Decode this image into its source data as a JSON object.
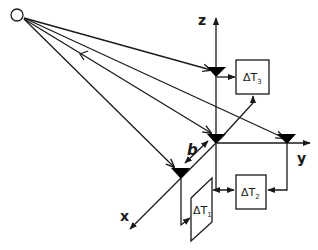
{
  "diagram": {
    "title": "",
    "source_point": {
      "label": "",
      "shape": "open-circle"
    },
    "axes": {
      "z": {
        "label": "z"
      },
      "y": {
        "label": "y"
      },
      "x": {
        "label": "x"
      }
    },
    "baseline_label": "b",
    "sensors": [
      {
        "id": "sensor-top",
        "shape": "filled-triangle"
      },
      {
        "id": "sensor-origin",
        "shape": "filled-triangle"
      },
      {
        "id": "sensor-right",
        "shape": "filled-triangle"
      },
      {
        "id": "sensor-front",
        "shape": "filled-triangle"
      }
    ],
    "boxes": [
      {
        "id": "delta-t3",
        "symbol": "ΔT",
        "subscript": "3"
      },
      {
        "id": "delta-t2",
        "symbol": "ΔT",
        "subscript": "2"
      },
      {
        "id": "delta-t1",
        "symbol": "ΔT",
        "subscript": "1"
      }
    ],
    "colors": {
      "stroke": "#1a1a1a",
      "sensor_fill": "#000000",
      "background": "#ffffff"
    }
  }
}
